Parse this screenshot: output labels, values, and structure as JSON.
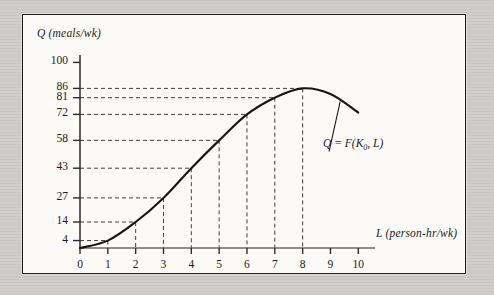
{
  "figure": {
    "kind": "production-function-graph"
  },
  "chart_data": {
    "type": "line",
    "title": "",
    "subtitle": "",
    "xlabel": "L (person-hr/wk)",
    "ylabel": "Q (meals/wk)",
    "xlim": [
      0,
      10.6
    ],
    "ylim": [
      0,
      104
    ],
    "grid": false,
    "legend_position": "none",
    "x_ticks": [
      0,
      1,
      2,
      3,
      4,
      5,
      6,
      7,
      8,
      9,
      10
    ],
    "x_tick_labels": [
      "0",
      "1",
      "2",
      "3",
      "4",
      "5",
      "6",
      "7",
      "8",
      "9",
      "10"
    ],
    "y_ticks": [
      4,
      14,
      27,
      43,
      58,
      72,
      81,
      86,
      100
    ],
    "y_tick_labels": [
      "4",
      "14",
      "27",
      "43",
      "58",
      "72",
      "81",
      "86",
      "100"
    ],
    "x": [
      1,
      2,
      3,
      4,
      5,
      6,
      7,
      8
    ],
    "values": [
      4,
      14,
      27,
      43,
      58,
      72,
      81,
      86
    ],
    "series": [
      {
        "name": "Q = F(K0, L)",
        "points": [
          {
            "x": 0,
            "y": 0
          },
          {
            "x": 1,
            "y": 4
          },
          {
            "x": 2,
            "y": 14
          },
          {
            "x": 3,
            "y": 27
          },
          {
            "x": 4,
            "y": 43
          },
          {
            "x": 5,
            "y": 58
          },
          {
            "x": 6,
            "y": 72
          },
          {
            "x": 7,
            "y": 81
          },
          {
            "x": 8,
            "y": 86
          },
          {
            "x": 9,
            "y": 83
          },
          {
            "x": 10,
            "y": 73
          }
        ]
      }
    ],
    "annotations": [
      {
        "name": "curve-equation",
        "text_q": "Q",
        "text_eq": " = ",
        "text_f": "F(K",
        "text_sub": "0",
        "text_tail": ", L)",
        "x": 8.55,
        "y": 44
      }
    ],
    "guide_lines": "dashed horizontal and vertical droplines at each labeled point"
  },
  "axis": {
    "y_title": "Q (meals/wk)",
    "x_title": "L (person-hr/wk)"
  },
  "curve_label": {
    "lead": "Q = F(K",
    "sub": "0",
    "tail": ", L)"
  }
}
